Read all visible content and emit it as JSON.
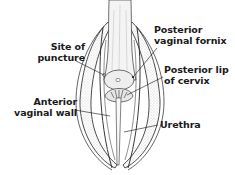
{
  "figure": {
    "type": "anatomical illustration",
    "labels": {
      "posterior_vaginal_fornix": [
        "Posterior",
        "vaginal fornix"
      ],
      "site_of_puncture": [
        "Site of",
        "puncture"
      ],
      "posterior_lip_of_cervix": [
        "Posterior lip",
        "of cervix"
      ],
      "anterior_vaginal_wall": [
        "Anterior",
        "vaginal wall"
      ],
      "urethra": [
        "Urethra"
      ]
    },
    "colors": {
      "ink": "#1a1a1a",
      "background": "#ffffff",
      "stipple": "#8a8a8a"
    }
  }
}
